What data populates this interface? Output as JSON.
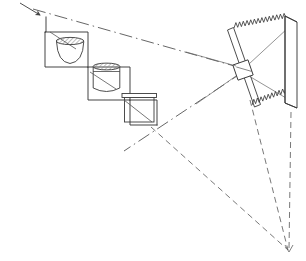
{
  "figure": {
    "canvas": {
      "width": 306,
      "height": 261,
      "background": "#ffffff"
    },
    "stroke": {
      "solid": "#333333",
      "construction": "#555555",
      "ray": "#666666",
      "hatch": "#777777"
    },
    "line_widths": {
      "solid": 0.9,
      "construction": 0.8,
      "ray": 0.8
    }
  },
  "geometry": {
    "incoming_ray_arrow": {
      "name": "incoming-ray-arrow",
      "from": [
        20,
        3
      ],
      "to": [
        46,
        20
      ],
      "arrow_at": [
        40,
        15
      ]
    },
    "staircase_outline": {
      "name": "stepped-platform",
      "points": [
        [
          46,
          18
        ],
        [
          46,
          32
        ],
        [
          45,
          32
        ],
        [
          45,
          67
        ],
        [
          88,
          67
        ],
        [
          88,
          100
        ],
        [
          130,
          100
        ],
        [
          130,
          125
        ],
        [
          156,
          125
        ]
      ]
    },
    "staircase_risers": [
      {
        "name": "riser-1",
        "points": [
          [
            45,
            32
          ],
          [
            88,
            32
          ],
          [
            88,
            67
          ]
        ]
      },
      {
        "name": "riser-2",
        "points": [
          [
            88,
            67
          ],
          [
            130,
            67
          ],
          [
            130,
            100
          ]
        ]
      },
      {
        "name": "riser-3",
        "points": [
          [
            130,
            100
          ],
          [
            156,
            100
          ],
          [
            156,
            125
          ]
        ]
      }
    ],
    "vessels": [
      {
        "name": "vessel-bowl",
        "kind": "shallow-bowl",
        "rim": {
          "x": 56,
          "y": 38,
          "w": 28,
          "h": 7
        },
        "body_path": "M 56 41 Q 57 63 70 64 Q 83 63 84 41 Z",
        "pointer": {
          "from": [
            50,
            32
          ],
          "to": [
            76,
            49
          ]
        }
      },
      {
        "name": "vessel-jar",
        "kind": "tall-cylinder",
        "rim": {
          "x": 93,
          "y": 64,
          "w": 27,
          "h": 7
        },
        "body": {
          "x": 93,
          "y": 67,
          "w": 27,
          "h": 26
        },
        "base_curve": "M 93 90 Q 106 96 120 90",
        "pointer": {
          "from": [
            90,
            72
          ],
          "to": [
            116,
            89
          ]
        }
      },
      {
        "name": "vessel-box",
        "kind": "rectangular-box",
        "rim": {
          "x": 124,
          "y": 94,
          "w": 30,
          "h": 6
        },
        "body": {
          "x": 124,
          "y": 97,
          "w": 30,
          "h": 25
        },
        "lip_top": [
          [
            121,
            94
          ],
          [
            157,
            94
          ]
        ],
        "pointer": {
          "from": [
            124,
            100
          ],
          "to": [
            152,
            122
          ]
        }
      }
    ],
    "aperture_plate": {
      "name": "tilted-aperture-plate",
      "near_edge": [
        [
          228,
          29
        ],
        [
          255,
          106
        ]
      ],
      "far_edge": [
        [
          234,
          27
        ],
        [
          261,
          104
        ]
      ],
      "cap_top": [
        [
          228,
          29
        ],
        [
          234,
          27
        ]
      ],
      "cap_bottom": [
        [
          255,
          106
        ],
        [
          261,
          104
        ]
      ],
      "aperture_box": {
        "cx": 243,
        "cy": 70,
        "w": 15,
        "h": 15,
        "rotate": -20
      }
    },
    "screen_bar": {
      "name": "screen-bar",
      "front_face": [
        [
          285,
          16
        ],
        [
          285,
          103
        ],
        [
          297,
          108
        ],
        [
          297,
          22
        ]
      ],
      "top_face": [
        [
          285,
          16
        ],
        [
          297,
          22
        ]
      ],
      "inner_edge": [
        [
          285,
          103
        ],
        [
          297,
          108
        ]
      ]
    },
    "sawtooth_rays": [
      {
        "name": "sawtooth-ray-upper",
        "from": [
          234,
          28
        ],
        "to": [
          286,
          18
        ],
        "teeth": 14,
        "amplitude": 5
      },
      {
        "name": "sawtooth-ray-lower",
        "from": [
          252,
          105
        ],
        "to": [
          288,
          92
        ],
        "teeth": 10,
        "amplitude": 5
      }
    ],
    "dash_dot_lines": [
      {
        "name": "optical-axis-upper",
        "from": [
          33,
          9
        ],
        "to": [
          245,
          69
        ]
      },
      {
        "name": "optical-axis-lower",
        "from": [
          243,
          72
        ],
        "to": [
          124,
          151
        ]
      }
    ],
    "dashed_rays": [
      {
        "name": "ray-from-box-to-focus",
        "from": [
          151,
          127
        ],
        "to": [
          288,
          250
        ]
      },
      {
        "name": "ray-plate-to-focus",
        "from": [
          250,
          100
        ],
        "to": [
          288,
          250
        ]
      },
      {
        "name": "ray-screen-to-focus",
        "from": [
          291,
          112
        ],
        "to": [
          289,
          250
        ]
      }
    ],
    "focus_point": {
      "name": "focus-point",
      "x": 288,
      "y": 250
    },
    "plate_rays_inside": [
      {
        "name": "plate-ray-a",
        "from": [
          249,
          64
        ],
        "to": [
          288,
          28
        ]
      },
      {
        "name": "plate-ray-b",
        "from": [
          249,
          76
        ],
        "to": [
          286,
          98
        ]
      },
      {
        "name": "plate-ray-c",
        "from": [
          236,
          66
        ],
        "to": [
          186,
          52
        ]
      },
      {
        "name": "plate-ray-d",
        "from": [
          236,
          76
        ],
        "to": [
          196,
          104
        ]
      }
    ]
  }
}
